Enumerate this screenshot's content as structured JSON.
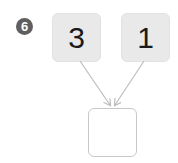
{
  "problem": {
    "number": "6",
    "inputs": [
      {
        "value": "3"
      },
      {
        "value": "1"
      }
    ],
    "answer": {
      "value": ""
    }
  },
  "colors": {
    "badge": "#5f5f5f",
    "input_box_fill": "#e9e9e9",
    "answer_box_border": "#c8c8c8",
    "arrow": "#bdbdbd"
  },
  "icons": {
    "arrows": [
      "arrow-down-right-icon",
      "arrow-down-left-icon"
    ]
  }
}
